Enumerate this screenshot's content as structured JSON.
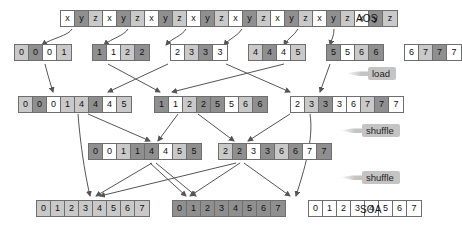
{
  "diagram": {
    "colors": {
      "white": "#ffffff",
      "light_gray": "#c9c9c9",
      "dark_gray": "#8f8f8f",
      "border": "#6e6e6e",
      "arrow": "#555555",
      "tag_bg": "#c4c4c4",
      "text": "#111111"
    },
    "labels": {
      "aos": "AOS",
      "soa": "SOA",
      "load": "load",
      "shuffle_1": "shuffle",
      "shuffle_2": "shuffle"
    },
    "rows": [
      {
        "name": "aos-row",
        "groups": [
          {
            "cells": [
              {
                "t": "x",
                "s": "w"
              },
              {
                "t": "y",
                "s": "d"
              },
              {
                "t": "z",
                "s": "l"
              },
              {
                "t": "x",
                "s": "w"
              },
              {
                "t": "y",
                "s": "d"
              },
              {
                "t": "z",
                "s": "l"
              },
              {
                "t": "x",
                "s": "w"
              },
              {
                "t": "y",
                "s": "d"
              },
              {
                "t": "z",
                "s": "l"
              },
              {
                "t": "x",
                "s": "w"
              },
              {
                "t": "y",
                "s": "d"
              },
              {
                "t": "z",
                "s": "l"
              },
              {
                "t": "x",
                "s": "w"
              },
              {
                "t": "y",
                "s": "d"
              },
              {
                "t": "z",
                "s": "l"
              },
              {
                "t": "x",
                "s": "w"
              },
              {
                "t": "y",
                "s": "d"
              },
              {
                "t": "z",
                "s": "l"
              },
              {
                "t": "x",
                "s": "w"
              },
              {
                "t": "y",
                "s": "d"
              },
              {
                "t": "z",
                "s": "l"
              },
              {
                "t": "x",
                "s": "w"
              },
              {
                "t": "y",
                "s": "d"
              },
              {
                "t": "z",
                "s": "l"
              }
            ]
          }
        ]
      },
      {
        "name": "loaded-row",
        "groups": [
          {
            "cells": [
              {
                "t": "0",
                "s": "l"
              },
              {
                "t": "0",
                "s": "d"
              },
              {
                "t": "0",
                "s": "w"
              },
              {
                "t": "1",
                "s": "l"
              }
            ]
          },
          {
            "cells": [
              {
                "t": "1",
                "s": "d"
              },
              {
                "t": "1",
                "s": "w"
              },
              {
                "t": "2",
                "s": "l"
              },
              {
                "t": "2",
                "s": "d"
              }
            ]
          },
          {
            "cells": [
              {
                "t": "2",
                "s": "w"
              },
              {
                "t": "3",
                "s": "l"
              },
              {
                "t": "3",
                "s": "d"
              },
              {
                "t": "3",
                "s": "w"
              }
            ]
          },
          {
            "cells": [
              {
                "t": "4",
                "s": "l"
              },
              {
                "t": "4",
                "s": "d"
              },
              {
                "t": "4",
                "s": "w"
              },
              {
                "t": "5",
                "s": "l"
              }
            ]
          },
          {
            "cells": [
              {
                "t": "5",
                "s": "d"
              },
              {
                "t": "5",
                "s": "w"
              },
              {
                "t": "6",
                "s": "l"
              },
              {
                "t": "6",
                "s": "d"
              }
            ]
          },
          {
            "cells": [
              {
                "t": "6",
                "s": "w"
              },
              {
                "t": "7",
                "s": "l"
              },
              {
                "t": "7",
                "s": "d"
              },
              {
                "t": "7",
                "s": "w"
              }
            ]
          }
        ]
      },
      {
        "name": "shuffle-1-row",
        "groups": [
          {
            "cells": [
              {
                "t": "0",
                "s": "l"
              },
              {
                "t": "0",
                "s": "d"
              },
              {
                "t": "0",
                "s": "w"
              },
              {
                "t": "1",
                "s": "l"
              },
              {
                "t": "4",
                "s": "l"
              },
              {
                "t": "4",
                "s": "d"
              },
              {
                "t": "4",
                "s": "w"
              },
              {
                "t": "5",
                "s": "l"
              }
            ]
          },
          {
            "cells": [
              {
                "t": "1",
                "s": "d"
              },
              {
                "t": "1",
                "s": "w"
              },
              {
                "t": "2",
                "s": "l"
              },
              {
                "t": "2",
                "s": "d"
              },
              {
                "t": "5",
                "s": "d"
              },
              {
                "t": "5",
                "s": "w"
              },
              {
                "t": "6",
                "s": "l"
              },
              {
                "t": "6",
                "s": "d"
              }
            ]
          },
          {
            "cells": [
              {
                "t": "2",
                "s": "w"
              },
              {
                "t": "3",
                "s": "l"
              },
              {
                "t": "3",
                "s": "d"
              },
              {
                "t": "3",
                "s": "w"
              },
              {
                "t": "6",
                "s": "w"
              },
              {
                "t": "7",
                "s": "l"
              },
              {
                "t": "7",
                "s": "d"
              },
              {
                "t": "7",
                "s": "w"
              }
            ]
          }
        ]
      },
      {
        "name": "shuffle-2-row",
        "groups": [
          {
            "cells": [
              {
                "t": "0",
                "s": "d"
              },
              {
                "t": "0",
                "s": "w"
              },
              {
                "t": "1",
                "s": "l"
              },
              {
                "t": "1",
                "s": "d"
              },
              {
                "t": "4",
                "s": "d"
              },
              {
                "t": "4",
                "s": "w"
              },
              {
                "t": "5",
                "s": "l"
              },
              {
                "t": "5",
                "s": "d"
              }
            ]
          },
          {
            "cells": [
              {
                "t": "2",
                "s": "l"
              },
              {
                "t": "2",
                "s": "d"
              },
              {
                "t": "3",
                "s": "w"
              },
              {
                "t": "3",
                "s": "d"
              },
              {
                "t": "6",
                "s": "l"
              },
              {
                "t": "6",
                "s": "d"
              },
              {
                "t": "7",
                "s": "w"
              },
              {
                "t": "7",
                "s": "d"
              }
            ]
          }
        ]
      },
      {
        "name": "soa-row",
        "groups": [
          {
            "cells": [
              {
                "t": "0",
                "s": "l"
              },
              {
                "t": "1",
                "s": "l"
              },
              {
                "t": "2",
                "s": "l"
              },
              {
                "t": "3",
                "s": "l"
              },
              {
                "t": "4",
                "s": "l"
              },
              {
                "t": "5",
                "s": "l"
              },
              {
                "t": "6",
                "s": "l"
              },
              {
                "t": "7",
                "s": "l"
              }
            ]
          },
          {
            "cells": [
              {
                "t": "0",
                "s": "d"
              },
              {
                "t": "1",
                "s": "d"
              },
              {
                "t": "2",
                "s": "d"
              },
              {
                "t": "3",
                "s": "d"
              },
              {
                "t": "4",
                "s": "d"
              },
              {
                "t": "5",
                "s": "d"
              },
              {
                "t": "6",
                "s": "d"
              },
              {
                "t": "7",
                "s": "d"
              }
            ]
          },
          {
            "cells": [
              {
                "t": "0",
                "s": "w"
              },
              {
                "t": "1",
                "s": "w"
              },
              {
                "t": "2",
                "s": "w"
              },
              {
                "t": "3",
                "s": "w"
              },
              {
                "t": "4",
                "s": "w"
              },
              {
                "t": "5",
                "s": "w"
              },
              {
                "t": "6",
                "s": "w"
              },
              {
                "t": "7",
                "s": "w"
              }
            ]
          }
        ]
      }
    ]
  }
}
